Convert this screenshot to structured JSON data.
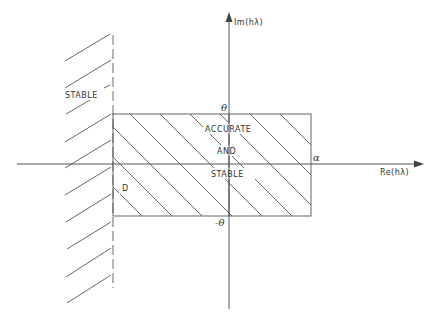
{
  "diagram": {
    "axes": {
      "x_label": "Re(hλ)",
      "y_label": "Im(hλ)"
    },
    "regions": {
      "left_label": "STABLE",
      "rect_label_line1": "ACCURATE",
      "rect_label_line2": "AND",
      "rect_label_line3": "STABLE",
      "d_label": "D"
    },
    "markers": {
      "theta_top": "θ",
      "theta_bottom": "-θ",
      "alpha": "α"
    },
    "colors": {
      "line": "#555555",
      "text": "#333333",
      "background": "#ffffff"
    }
  }
}
